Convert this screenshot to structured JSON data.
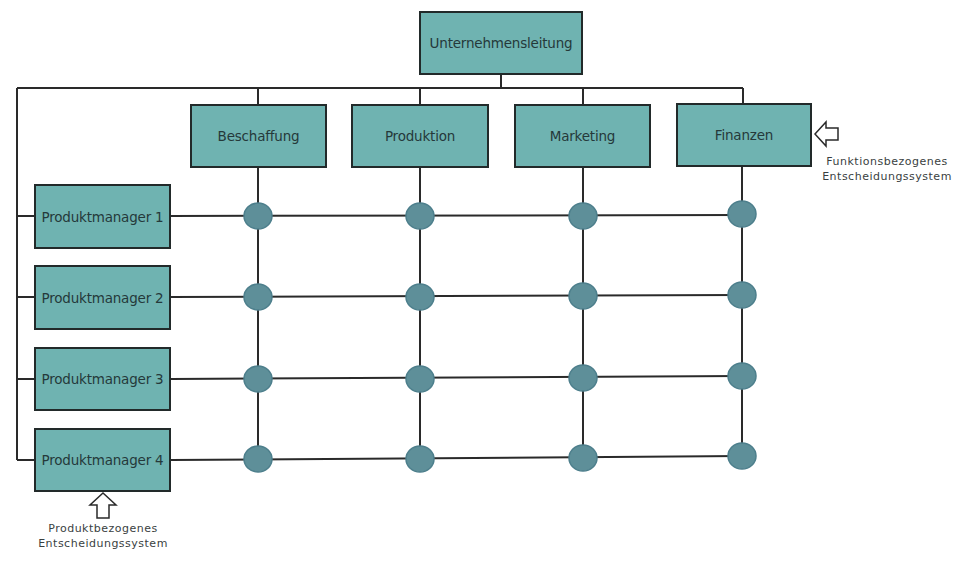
{
  "diagram": {
    "type": "matrix-organization",
    "top": {
      "label": "Unternehmensleitung"
    },
    "functions": [
      {
        "label": "Beschaffung"
      },
      {
        "label": "Produktion"
      },
      {
        "label": "Marketing"
      },
      {
        "label": "Finanzen"
      }
    ],
    "products": [
      {
        "label": "Produktmanager 1"
      },
      {
        "label": "Produktmanager 2"
      },
      {
        "label": "Produktmanager 3"
      },
      {
        "label": "Produktmanager 4"
      }
    ],
    "annotations": {
      "function_system": {
        "line1": "Funktionsbezogenes",
        "line2": "Entscheidungssystem",
        "icon": "arrow-left-icon"
      },
      "product_system": {
        "line1": "Produktbezogenes",
        "line2": "Entscheidungssystem",
        "icon": "arrow-up-icon"
      }
    },
    "colors": {
      "box_fill": "#6fb3b1",
      "box_border": "#222a2a",
      "node_fill": "#5e8f99",
      "node_border": "#4d7f8c",
      "line": "#2a2a2a",
      "text": "#25393a"
    }
  }
}
